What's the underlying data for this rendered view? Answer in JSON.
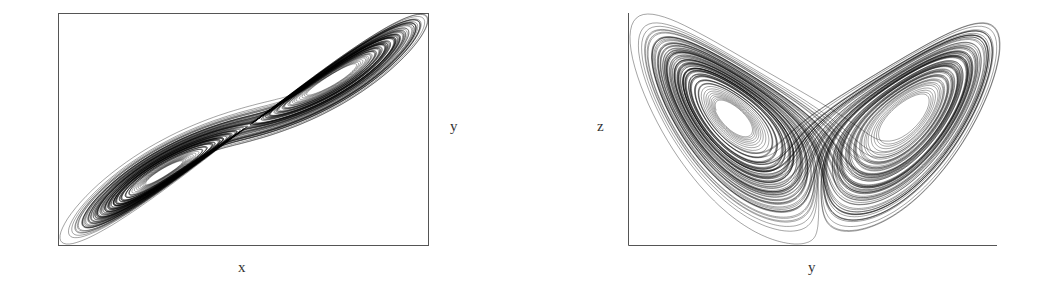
{
  "chart_data": [
    {
      "type": "line",
      "title": "",
      "description": "Lorenz attractor trajectory projected onto the x-y plane",
      "xlabel": "x",
      "ylabel": "y",
      "frame": "box",
      "grid": false,
      "ticks": false,
      "series": [
        {
          "name": "trajectory",
          "color": "#000000"
        }
      ]
    },
    {
      "type": "line",
      "title": "",
      "description": "Lorenz attractor trajectory shown as butterfly (two lobes) projection",
      "xlabel": "y",
      "ylabel": "z",
      "frame": "left-bottom-axes",
      "grid": false,
      "ticks": false,
      "series": [
        {
          "name": "trajectory",
          "color": "#000000"
        }
      ]
    }
  ],
  "labels": {
    "left_x": "x",
    "left_y": "y",
    "right_x": "y",
    "right_y": "z"
  },
  "style": {
    "line_color": "#000000",
    "axis_color": "#555555"
  }
}
